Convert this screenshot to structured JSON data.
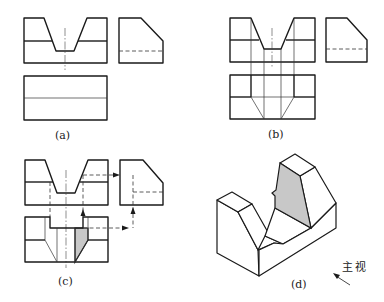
{
  "figure": {
    "type": "orthographic-projection exercise",
    "panels": [
      {
        "id": "a",
        "label": "(a)",
        "description": "Front view, side view and incomplete top view"
      },
      {
        "id": "b",
        "label": "(b)",
        "description": "Top view with projected notch lines"
      },
      {
        "id": "c",
        "label": "(c)",
        "description": "Projection of inclined face with construction arrows, shaded face"
      },
      {
        "id": "d",
        "label": "(d)",
        "description": "Isometric view with shaded inclined face"
      }
    ],
    "view_direction_label": "主视",
    "colors": {
      "line": "#1a1a1a",
      "shade": "#c8c8c8",
      "background": "#ffffff"
    }
  }
}
